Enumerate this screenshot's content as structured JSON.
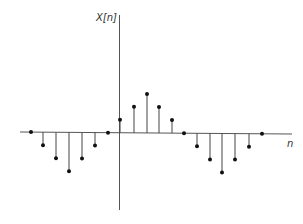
{
  "chart_data": {
    "type": "stem",
    "title": "",
    "xlabel": "n",
    "ylabel": "X[n]",
    "x": [
      -9,
      -8,
      -7,
      -6,
      -5,
      -4,
      -3,
      -2,
      -1,
      0,
      1,
      2,
      3,
      4,
      5,
      6,
      7,
      8,
      9
    ],
    "values": [
      0,
      -1,
      -2,
      -3,
      -2,
      -1,
      0,
      1,
      2,
      3,
      2,
      1,
      0,
      -1,
      -2,
      -3,
      -2,
      -1,
      0
    ],
    "note_x_positions_px": [
      31,
      43,
      56,
      69,
      82,
      95,
      108,
      120,
      134,
      147,
      159,
      172,
      184,
      197,
      210,
      222,
      235,
      249,
      262
    ],
    "grid": false,
    "legend": null,
    "ylim": [
      -3,
      3
    ]
  },
  "colors": {
    "axis": "#555555",
    "stem": "#444444",
    "marker": "#111111",
    "label": "#333333"
  },
  "labels": {
    "y_axis": "X[n]",
    "x_axis": "n"
  }
}
